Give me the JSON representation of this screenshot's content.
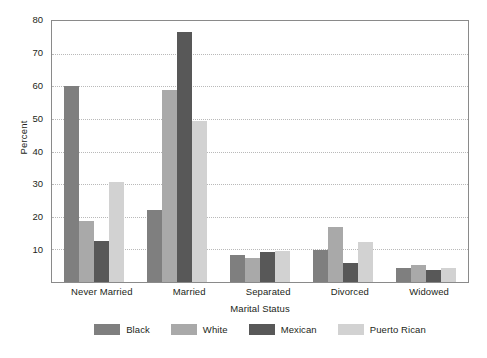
{
  "chart_data": {
    "type": "bar",
    "title": "",
    "xlabel": "Marital Status",
    "ylabel": "Percent",
    "categories": [
      "Never Married",
      "Married",
      "Separated",
      "Divorced",
      "Widowed"
    ],
    "ylim": [
      0,
      80
    ],
    "yticks": [
      10,
      20,
      30,
      40,
      50,
      60,
      70,
      80
    ],
    "ytick_labels": [
      "10",
      "20",
      "30",
      "40",
      "50",
      "60",
      "70",
      "80"
    ],
    "grid": true,
    "grid_axis": "y",
    "legend_position": "bottom",
    "series": [
      {
        "name": "Black",
        "color": "#7f7f7f",
        "values": [
          59.5,
          22.0,
          8.2,
          9.7,
          4.2
        ]
      },
      {
        "name": "White",
        "color": "#a9a9a9",
        "values": [
          18.5,
          58.5,
          7.3,
          16.7,
          5.3
        ]
      },
      {
        "name": "Mexican",
        "color": "#585858",
        "values": [
          12.5,
          76.0,
          9.0,
          5.8,
          3.8
        ]
      },
      {
        "name": "Puerto Rican",
        "color": "#d2d2d2",
        "values": [
          30.5,
          49.0,
          9.3,
          12.1,
          4.2
        ]
      }
    ]
  },
  "colors": {
    "frame": "#8a8a8a",
    "grid": "#b9b9b9",
    "text": "#231f20",
    "background": "#ffffff"
  }
}
